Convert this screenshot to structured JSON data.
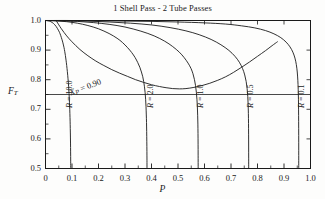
{
  "chart_data": {
    "type": "line",
    "title": "1 Shell Pass - 2 Tube Passes",
    "xlabel": "P",
    "ylabel": "F_T",
    "xlim": [
      0,
      1.0
    ],
    "ylim": [
      0.5,
      1.0
    ],
    "xticks": [
      "0",
      "0.1",
      "0.2",
      "0.3",
      "0.4",
      "0.5",
      "0.6",
      "0.7",
      "0.8",
      "0.9",
      "1.0"
    ],
    "xtick_values": [
      0,
      0.1,
      0.2,
      0.3,
      0.4,
      0.5,
      0.6,
      0.7,
      0.8,
      0.9,
      1.0
    ],
    "yticks": [
      "0.5",
      "0.6",
      "0.7",
      "0.8",
      "0.9",
      "1.0"
    ],
    "ytick_values": [
      0.5,
      0.6,
      0.7,
      0.8,
      0.9,
      1.0
    ],
    "grid": false,
    "legend": "inline-curve-labels",
    "reference_line": {
      "name": "FT-0.75-line",
      "orientation": "horizontal",
      "value": 0.75
    },
    "series": [
      {
        "name": "R = 10.0",
        "label": "R = 10.0",
        "label_value": "10.0",
        "points": [
          [
            0.0,
            1.0
          ],
          [
            0.01,
            0.999
          ],
          [
            0.02,
            0.996
          ],
          [
            0.03,
            0.99
          ],
          [
            0.04,
            0.98
          ],
          [
            0.05,
            0.965
          ],
          [
            0.055,
            0.955
          ],
          [
            0.06,
            0.942
          ],
          [
            0.065,
            0.927
          ],
          [
            0.07,
            0.908
          ],
          [
            0.0725,
            0.896
          ],
          [
            0.075,
            0.882
          ],
          [
            0.0775,
            0.866
          ],
          [
            0.08,
            0.848
          ],
          [
            0.0825,
            0.827
          ],
          [
            0.085,
            0.803
          ],
          [
            0.0865,
            0.786
          ],
          [
            0.088,
            0.766
          ],
          [
            0.0895,
            0.742
          ],
          [
            0.0905,
            0.722
          ],
          [
            0.0915,
            0.7
          ],
          [
            0.0925,
            0.672
          ],
          [
            0.0932,
            0.648
          ],
          [
            0.0938,
            0.62
          ],
          [
            0.0944,
            0.586
          ],
          [
            0.0948,
            0.556
          ],
          [
            0.0951,
            0.525
          ],
          [
            0.0953,
            0.5
          ]
        ]
      },
      {
        "name": "R = 2.0",
        "label": "R = 2.0",
        "label_value": "2.0",
        "points": [
          [
            0.0,
            1.0
          ],
          [
            0.04,
            0.999
          ],
          [
            0.08,
            0.996
          ],
          [
            0.12,
            0.991
          ],
          [
            0.16,
            0.983
          ],
          [
            0.2,
            0.972
          ],
          [
            0.24,
            0.956
          ],
          [
            0.27,
            0.94
          ],
          [
            0.29,
            0.926
          ],
          [
            0.31,
            0.908
          ],
          [
            0.325,
            0.892
          ],
          [
            0.338,
            0.875
          ],
          [
            0.348,
            0.858
          ],
          [
            0.356,
            0.842
          ],
          [
            0.362,
            0.826
          ],
          [
            0.367,
            0.81
          ],
          [
            0.3705,
            0.794
          ],
          [
            0.3735,
            0.776
          ],
          [
            0.376,
            0.756
          ],
          [
            0.3778,
            0.734
          ],
          [
            0.3792,
            0.71
          ],
          [
            0.3803,
            0.684
          ],
          [
            0.3812,
            0.655
          ],
          [
            0.3818,
            0.625
          ],
          [
            0.3823,
            0.592
          ],
          [
            0.3827,
            0.558
          ],
          [
            0.3829,
            0.528
          ],
          [
            0.383,
            0.5
          ]
        ]
      },
      {
        "name": "R = 1.0",
        "label": "R = 1.0",
        "label_value": "1.0",
        "points": [
          [
            0.0,
            1.0
          ],
          [
            0.06,
            0.999
          ],
          [
            0.12,
            0.997
          ],
          [
            0.18,
            0.993
          ],
          [
            0.24,
            0.987
          ],
          [
            0.3,
            0.978
          ],
          [
            0.36,
            0.964
          ],
          [
            0.41,
            0.948
          ],
          [
            0.45,
            0.93
          ],
          [
            0.48,
            0.912
          ],
          [
            0.505,
            0.893
          ],
          [
            0.523,
            0.875
          ],
          [
            0.538,
            0.856
          ],
          [
            0.549,
            0.838
          ],
          [
            0.5565,
            0.82
          ],
          [
            0.5622,
            0.8
          ],
          [
            0.5662,
            0.78
          ],
          [
            0.5692,
            0.758
          ],
          [
            0.5715,
            0.734
          ],
          [
            0.5731,
            0.708
          ],
          [
            0.5742,
            0.68
          ],
          [
            0.575,
            0.65
          ],
          [
            0.5755,
            0.618
          ],
          [
            0.5758,
            0.582
          ],
          [
            0.576,
            0.545
          ],
          [
            0.5761,
            0.5
          ]
        ]
      },
      {
        "name": "R = 0.5",
        "label": "R = 0.5",
        "label_value": "0.5",
        "points": [
          [
            0.0,
            1.0
          ],
          [
            0.08,
            0.999
          ],
          [
            0.16,
            0.998
          ],
          [
            0.24,
            0.995
          ],
          [
            0.32,
            0.991
          ],
          [
            0.4,
            0.985
          ],
          [
            0.47,
            0.976
          ],
          [
            0.53,
            0.965
          ],
          [
            0.58,
            0.952
          ],
          [
            0.625,
            0.936
          ],
          [
            0.662,
            0.918
          ],
          [
            0.692,
            0.899
          ],
          [
            0.715,
            0.879
          ],
          [
            0.7315,
            0.859
          ],
          [
            0.7435,
            0.838
          ],
          [
            0.7518,
            0.816
          ],
          [
            0.7572,
            0.794
          ],
          [
            0.7608,
            0.77
          ],
          [
            0.7632,
            0.744
          ],
          [
            0.7647,
            0.716
          ],
          [
            0.7656,
            0.686
          ],
          [
            0.7661,
            0.652
          ],
          [
            0.7664,
            0.616
          ],
          [
            0.7666,
            0.576
          ],
          [
            0.7667,
            0.535
          ],
          [
            0.7667,
            0.5
          ]
        ]
      },
      {
        "name": "R = 0.1",
        "label": "R = 0.1",
        "label_value": "0.1",
        "points": [
          [
            0.0,
            1.0
          ],
          [
            0.1,
            1.0
          ],
          [
            0.2,
            0.999
          ],
          [
            0.3,
            0.998
          ],
          [
            0.4,
            0.997
          ],
          [
            0.5,
            0.995
          ],
          [
            0.6,
            0.992
          ],
          [
            0.68,
            0.988
          ],
          [
            0.74,
            0.982
          ],
          [
            0.79,
            0.975
          ],
          [
            0.83,
            0.966
          ],
          [
            0.862,
            0.955
          ],
          [
            0.888,
            0.942
          ],
          [
            0.908,
            0.927
          ],
          [
            0.9225,
            0.911
          ],
          [
            0.9335,
            0.893
          ],
          [
            0.9413,
            0.873
          ],
          [
            0.9465,
            0.851
          ],
          [
            0.95,
            0.826
          ],
          [
            0.9522,
            0.798
          ],
          [
            0.9536,
            0.768
          ],
          [
            0.9545,
            0.734
          ],
          [
            0.955,
            0.698
          ],
          [
            0.9553,
            0.658
          ],
          [
            0.9555,
            0.612
          ],
          [
            0.9556,
            0.56
          ],
          [
            0.9556,
            0.5
          ]
        ]
      },
      {
        "name": "Xp = 0.90",
        "label": "Xp = 0.90",
        "label_value": "0.90",
        "annotation": "Xp = 0.90",
        "points": [
          [
            0.04,
            1.0
          ],
          [
            0.06,
            0.972
          ],
          [
            0.08,
            0.948
          ],
          [
            0.1,
            0.928
          ],
          [
            0.13,
            0.902
          ],
          [
            0.16,
            0.881
          ],
          [
            0.19,
            0.863
          ],
          [
            0.22,
            0.848
          ],
          [
            0.25,
            0.834
          ],
          [
            0.28,
            0.822
          ],
          [
            0.31,
            0.811
          ],
          [
            0.34,
            0.8
          ],
          [
            0.37,
            0.791
          ],
          [
            0.4,
            0.783
          ],
          [
            0.43,
            0.777
          ],
          [
            0.455,
            0.773
          ],
          [
            0.48,
            0.77
          ],
          [
            0.505,
            0.769
          ],
          [
            0.53,
            0.77
          ],
          [
            0.56,
            0.774
          ],
          [
            0.59,
            0.78
          ],
          [
            0.62,
            0.788
          ],
          [
            0.65,
            0.798
          ],
          [
            0.68,
            0.81
          ],
          [
            0.71,
            0.825
          ],
          [
            0.74,
            0.842
          ],
          [
            0.77,
            0.86
          ],
          [
            0.8,
            0.879
          ],
          [
            0.83,
            0.898
          ],
          [
            0.855,
            0.915
          ],
          [
            0.875,
            0.928
          ]
        ]
      }
    ],
    "curve_label_positions": [
      {
        "series": "R = 10.0",
        "x": 65,
        "y": 108,
        "rotation": -90
      },
      {
        "series": "R = 2.0",
        "x": 146,
        "y": 108,
        "rotation": -90
      },
      {
        "series": "R = 1.0",
        "x": 196,
        "y": 108,
        "rotation": -90
      },
      {
        "series": "R = 0.5",
        "x": 246,
        "y": 108,
        "rotation": -90
      },
      {
        "series": "R = 0.1",
        "x": 297,
        "y": 108,
        "rotation": -90
      }
    ],
    "annotation_position": {
      "x": 68,
      "y": 88,
      "rotation": -21
    },
    "colors": {
      "axis": "#1a1a1a",
      "curve": "#1a1a1a",
      "background": "#fdfdfc"
    }
  }
}
